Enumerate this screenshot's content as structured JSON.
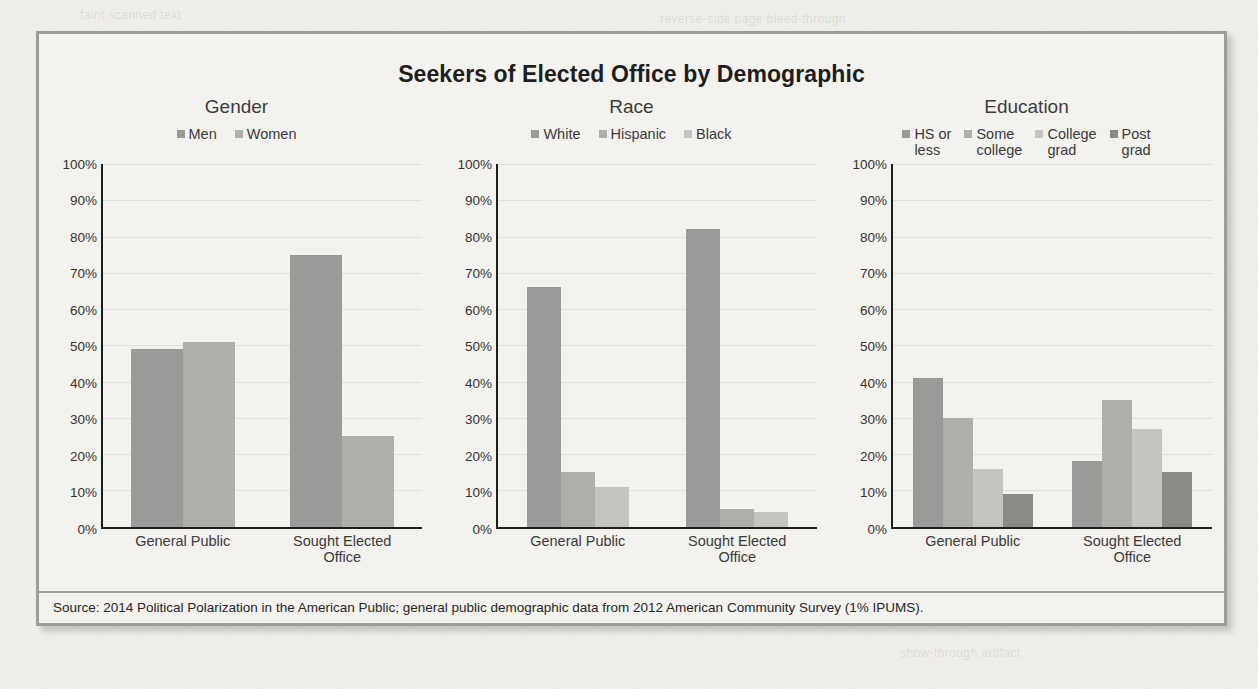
{
  "figure": {
    "title": "Seekers of Elected Office by Demographic",
    "source": "Source: 2014 Political Polarization in the American Public; general public demographic data from 2012 American Community Survey (1% IPUMS)."
  },
  "ghost_lines": [
    {
      "text": "reverse-side page bleed-through",
      "left": 660,
      "top": 12
    },
    {
      "text": "faint scanned text",
      "left": 80,
      "top": 8
    },
    {
      "text": "show-through artifact",
      "left": 900,
      "top": 646
    }
  ],
  "palette": {
    "series_dark": "#9a9a98",
    "series_mid": "#aeaeab",
    "series_light": "#c4c4c0",
    "series_darkest": "#8a8a86",
    "axis": "#1e1e1e",
    "frame": "#9c9c9a",
    "panel_bg": "#f3f2ee",
    "page_bg": "#efeeea"
  },
  "chart_data": [
    {
      "type": "bar",
      "title": "Gender",
      "xlabel": "",
      "ylabel": "",
      "ylim": [
        0,
        100
      ],
      "grid": true,
      "legend_position": "top",
      "categories": [
        "General Public",
        "Sought Elected\nOffice"
      ],
      "yticks": [
        "100%",
        "90%",
        "80%",
        "70%",
        "60%",
        "50%",
        "40%",
        "30%",
        "20%",
        "10%",
        "0%"
      ],
      "series": [
        {
          "name": "Men",
          "color": "#9a9a98",
          "values": [
            49,
            75
          ]
        },
        {
          "name": "Women",
          "color": "#aeaeab",
          "values": [
            51,
            25
          ]
        }
      ]
    },
    {
      "type": "bar",
      "title": "Race",
      "xlabel": "",
      "ylabel": "",
      "ylim": [
        0,
        100
      ],
      "grid": true,
      "legend_position": "top",
      "categories": [
        "General Public",
        "Sought Elected\nOffice"
      ],
      "yticks": [
        "100%",
        "90%",
        "80%",
        "70%",
        "60%",
        "50%",
        "40%",
        "30%",
        "20%",
        "10%",
        "0%"
      ],
      "series": [
        {
          "name": "White",
          "color": "#9a9a98",
          "values": [
            66,
            82
          ]
        },
        {
          "name": "Hispanic",
          "color": "#aeaeab",
          "values": [
            15,
            5
          ]
        },
        {
          "name": "Black",
          "color": "#c4c4c0",
          "values": [
            11,
            4
          ]
        }
      ]
    },
    {
      "type": "bar",
      "title": "Education",
      "xlabel": "",
      "ylabel": "",
      "ylim": [
        0,
        100
      ],
      "grid": true,
      "legend_position": "top",
      "categories": [
        "General Public",
        "Sought Elected\nOffice"
      ],
      "yticks": [
        "100%",
        "90%",
        "80%",
        "70%",
        "60%",
        "50%",
        "40%",
        "30%",
        "20%",
        "10%",
        "0%"
      ],
      "series": [
        {
          "name": "HS or\nless",
          "color": "#9a9a98",
          "values": [
            41,
            18
          ]
        },
        {
          "name": "Some\ncollege",
          "color": "#aeaeab",
          "values": [
            30,
            35
          ]
        },
        {
          "name": "College\ngrad",
          "color": "#c4c4c0",
          "values": [
            16,
            27
          ]
        },
        {
          "name": "Post\ngrad",
          "color": "#8a8a86",
          "values": [
            9,
            15
          ]
        }
      ]
    }
  ]
}
